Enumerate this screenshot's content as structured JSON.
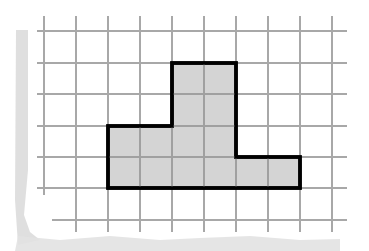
{
  "diagram": {
    "type": "grid-area-figure",
    "grid": {
      "cell_size_px": 32,
      "columns": 10,
      "rows": 7,
      "vertical_lines_x": [
        44,
        76,
        108,
        140,
        172,
        204,
        236,
        268,
        300,
        332
      ],
      "horizontal_lines_y": [
        31,
        63,
        94,
        126,
        157,
        188,
        220
      ],
      "line_color": "#a8a8a8"
    },
    "shape": {
      "fill_color": "#d4d4d4",
      "stroke_color": "#000000",
      "points": [
        [
          108,
          126
        ],
        [
          172,
          126
        ],
        [
          172,
          63
        ],
        [
          236,
          63
        ],
        [
          236,
          157
        ],
        [
          300,
          157
        ],
        [
          300,
          188
        ],
        [
          108,
          188
        ]
      ],
      "grid_units_area": 10,
      "parts": [
        {
          "name": "tall-column",
          "width_units": 2,
          "height_units": 4
        },
        {
          "name": "left-block",
          "width_units": 2,
          "height_units": 2
        },
        {
          "name": "right-foot",
          "width_units": 2,
          "height_units": 1
        }
      ]
    },
    "paper_shadow_color": "#d8d8d8"
  }
}
